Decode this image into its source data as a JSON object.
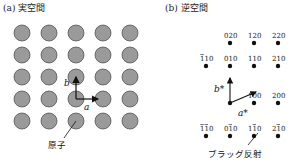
{
  "panel_a": {
    "title": "(a) 実空間",
    "grid_rows": 5,
    "grid_cols": 5,
    "atom_color": "#9a9a9a",
    "atom_stroke": "#444444",
    "vector_a_label": "a",
    "vector_b_label": "b",
    "annotation": "原子"
  },
  "panel_b": {
    "title": "(b) 逆空間",
    "point_color": "#111111",
    "vector_a_label": "a*",
    "vector_b_label": "b*",
    "annotation": "ブラッグ反射",
    "points": [
      {
        "label": "020",
        "bar": "",
        "col": 1,
        "row": 0
      },
      {
        "label": "120",
        "bar": "",
        "col": 2,
        "row": 0
      },
      {
        "label": "220",
        "bar": "",
        "col": 3,
        "row": 0
      },
      {
        "label": "110",
        "bar": "first",
        "col": 0,
        "row": 1
      },
      {
        "label": "010",
        "bar": "",
        "col": 1,
        "row": 1
      },
      {
        "label": "110",
        "bar": "",
        "col": 2,
        "row": 1
      },
      {
        "label": "210",
        "bar": "",
        "col": 3,
        "row": 1
      },
      {
        "label": "100",
        "bar": "",
        "col": 2,
        "row": 2
      },
      {
        "label": "200",
        "bar": "",
        "col": 3,
        "row": 2
      },
      {
        "label": "110",
        "bar": "first-second",
        "col": 0,
        "row": 3
      },
      {
        "label": "010",
        "bar": "second",
        "col": 1,
        "row": 3
      },
      {
        "label": "110",
        "bar": "second",
        "col": 2,
        "row": 3
      },
      {
        "label": "210",
        "bar": "second",
        "col": 3,
        "row": 3
      }
    ]
  }
}
